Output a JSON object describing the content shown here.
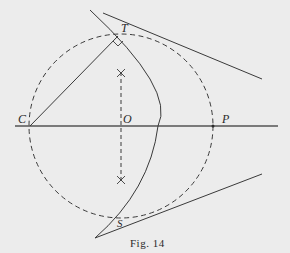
{
  "figure": {
    "caption": "Fig. 14",
    "background_color": "#ececec",
    "line_color": "#3a3a3a"
  },
  "points": {
    "C": {
      "label": "C",
      "x": 30,
      "y": 126
    },
    "O": {
      "label": "O",
      "x": 121,
      "y": 126
    },
    "P": {
      "label": "P",
      "x": 213,
      "y": 126
    },
    "T": {
      "label": "T",
      "x": 118,
      "y": 36
    },
    "S": {
      "label": "S",
      "x": 121,
      "y": 216
    }
  },
  "elements": {
    "dashed_circle": {
      "center": "O",
      "radius": 92,
      "style": "dashed"
    },
    "baseline": {
      "from": [
        15,
        126
      ],
      "to": [
        278,
        126
      ],
      "style": "solid"
    },
    "segment_CT": {
      "from": "C",
      "to": "T",
      "style": "solid"
    },
    "tangent_PT": {
      "from": [
        103,
        12
      ],
      "to": [
        262,
        79
      ],
      "through": "P",
      "style": "solid"
    },
    "tangent_PS": {
      "from": [
        108,
        229
      ],
      "to": [
        262,
        174
      ],
      "through": "P",
      "style": "solid"
    },
    "solid_arc": {
      "center": "C",
      "through": [
        "T",
        "S"
      ],
      "style": "solid"
    },
    "perpendicular_bisector": {
      "x": 121,
      "from_y": 72,
      "to_y": 180,
      "style": "dashed"
    },
    "right_angle_marker": {
      "at": "T"
    },
    "bisector_marks": [
      {
        "x": 121,
        "y": 73
      },
      {
        "x": 121,
        "y": 180
      }
    ]
  }
}
